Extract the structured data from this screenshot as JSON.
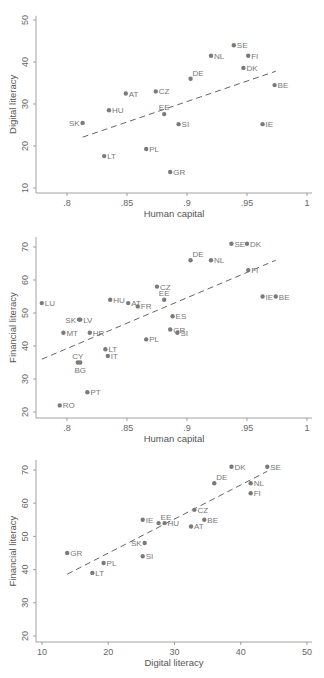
{
  "chart_data": [
    {
      "type": "scatter",
      "title": "",
      "xlabel": "Human capital",
      "ylabel": "Digital literacy",
      "xlim": [
        0.775,
        1.005
      ],
      "ylim": [
        9,
        51
      ],
      "xticks": [
        0.8,
        0.85,
        0.9,
        0.95,
        1
      ],
      "xtick_labels": [
        ".8",
        ".85",
        ".9",
        ".95",
        "1"
      ],
      "yticks": [
        10,
        20,
        30,
        40,
        50
      ],
      "ytick_labels": [
        "10",
        "20",
        "30",
        "40",
        "50"
      ],
      "grid": false,
      "legend": "none",
      "points": [
        {
          "label": "SE",
          "x": 0.939,
          "y": 44.0
        },
        {
          "label": "NL",
          "x": 0.92,
          "y": 41.5
        },
        {
          "label": "FI",
          "x": 0.951,
          "y": 41.5
        },
        {
          "label": "DK",
          "x": 0.947,
          "y": 38.6
        },
        {
          "label": "DE",
          "x": 0.903,
          "y": 36.0
        },
        {
          "label": "BE",
          "x": 0.973,
          "y": 34.5
        },
        {
          "label": "CZ",
          "x": 0.874,
          "y": 33.0
        },
        {
          "label": "AT",
          "x": 0.849,
          "y": 32.5
        },
        {
          "label": "HU",
          "x": 0.835,
          "y": 28.5
        },
        {
          "label": "EE",
          "x": 0.881,
          "y": 27.6
        },
        {
          "label": "SK",
          "x": 0.813,
          "y": 25.5
        },
        {
          "label": "SI",
          "x": 0.893,
          "y": 25.2
        },
        {
          "label": "IE",
          "x": 0.963,
          "y": 25.2
        },
        {
          "label": "PL",
          "x": 0.866,
          "y": 19.3
        },
        {
          "label": "LT",
          "x": 0.831,
          "y": 17.6
        },
        {
          "label": "GR",
          "x": 0.886,
          "y": 13.8
        }
      ],
      "fit_line": {
        "x": [
          0.813,
          0.974
        ],
        "y": [
          22.1,
          37.8
        ],
        "style": "dashed"
      }
    },
    {
      "type": "scatter",
      "title": "",
      "xlabel": "Human capital",
      "ylabel": "Financial literacy",
      "xlim": [
        0.775,
        1.005
      ],
      "ylim": [
        18,
        73
      ],
      "xticks": [
        0.8,
        0.85,
        0.9,
        0.95,
        1
      ],
      "xtick_labels": [
        ".8",
        ".85",
        ".9",
        ".95",
        "1"
      ],
      "yticks": [
        20,
        30,
        40,
        50,
        60,
        70
      ],
      "ytick_labels": [
        "20",
        "30",
        "40",
        "50",
        "60",
        "70"
      ],
      "grid": false,
      "legend": "none",
      "points": [
        {
          "label": "SE",
          "x": 0.937,
          "y": 71.0
        },
        {
          "label": "DK",
          "x": 0.95,
          "y": 71.0
        },
        {
          "label": "DE",
          "x": 0.903,
          "y": 66.0
        },
        {
          "label": "NL",
          "x": 0.92,
          "y": 66.0
        },
        {
          "label": "FI",
          "x": 0.951,
          "y": 63.0
        },
        {
          "label": "CZ",
          "x": 0.875,
          "y": 58.0
        },
        {
          "label": "EE",
          "x": 0.881,
          "y": 54.0
        },
        {
          "label": "IE",
          "x": 0.963,
          "y": 55.0
        },
        {
          "label": "BE",
          "x": 0.974,
          "y": 55.0
        },
        {
          "label": "LU",
          "x": 0.779,
          "y": 53.0
        },
        {
          "label": "HU",
          "x": 0.836,
          "y": 54.0
        },
        {
          "label": "AT",
          "x": 0.851,
          "y": 53.0
        },
        {
          "label": "FR",
          "x": 0.859,
          "y": 52.0
        },
        {
          "label": "ES",
          "x": 0.888,
          "y": 49.0
        },
        {
          "label": "SK",
          "x": 0.81,
          "y": 48.0
        },
        {
          "label": "LV",
          "x": 0.811,
          "y": 48.0
        },
        {
          "label": "GR",
          "x": 0.886,
          "y": 45.0
        },
        {
          "label": "SI",
          "x": 0.892,
          "y": 44.0
        },
        {
          "label": "MT",
          "x": 0.797,
          "y": 44.0
        },
        {
          "label": "HR",
          "x": 0.819,
          "y": 44.0
        },
        {
          "label": "PL",
          "x": 0.866,
          "y": 42.0
        },
        {
          "label": "LT",
          "x": 0.832,
          "y": 39.0
        },
        {
          "label": "IT",
          "x": 0.834,
          "y": 37.0
        },
        {
          "label": "CY",
          "x": 0.809,
          "y": 35.0
        },
        {
          "label": "BG",
          "x": 0.811,
          "y": 35.0
        },
        {
          "label": "PT",
          "x": 0.817,
          "y": 26.0
        },
        {
          "label": "RO",
          "x": 0.794,
          "y": 22.0
        }
      ],
      "fit_line": {
        "x": [
          0.779,
          0.974
        ],
        "y": [
          36.0,
          66.0
        ],
        "style": "dashed"
      }
    },
    {
      "type": "scatter",
      "title": "",
      "xlabel": "Digital literacy",
      "ylabel": "Financial literacy",
      "xlim": [
        9,
        51
      ],
      "ylim": [
        18,
        73
      ],
      "xticks": [
        10,
        20,
        30,
        40,
        50
      ],
      "xtick_labels": [
        "10",
        "20",
        "30",
        "40",
        "50"
      ],
      "yticks": [
        20,
        30,
        40,
        50,
        60,
        70
      ],
      "ytick_labels": [
        "20",
        "30",
        "40",
        "50",
        "60",
        "70"
      ],
      "grid": false,
      "legend": "none",
      "points": [
        {
          "label": "DK",
          "x": 38.6,
          "y": 71.0
        },
        {
          "label": "SE",
          "x": 44.0,
          "y": 71.0
        },
        {
          "label": "DE",
          "x": 36.0,
          "y": 66.0
        },
        {
          "label": "NL",
          "x": 41.5,
          "y": 66.0
        },
        {
          "label": "FI",
          "x": 41.5,
          "y": 63.0
        },
        {
          "label": "CZ",
          "x": 33.0,
          "y": 58.0
        },
        {
          "label": "IE",
          "x": 25.2,
          "y": 55.0
        },
        {
          "label": "BE",
          "x": 34.5,
          "y": 55.0
        },
        {
          "label": "EE",
          "x": 27.6,
          "y": 54.0
        },
        {
          "label": "HU",
          "x": 28.5,
          "y": 54.0
        },
        {
          "label": "AT",
          "x": 32.5,
          "y": 53.0
        },
        {
          "label": "SK",
          "x": 25.5,
          "y": 48.0
        },
        {
          "label": "GR",
          "x": 13.8,
          "y": 45.0
        },
        {
          "label": "SI",
          "x": 25.2,
          "y": 44.0
        },
        {
          "label": "PL",
          "x": 19.3,
          "y": 42.0
        },
        {
          "label": "LT",
          "x": 17.6,
          "y": 39.0
        }
      ],
      "fit_line": {
        "x": [
          13.8,
          44.0
        ],
        "y": [
          38.6,
          69.6
        ],
        "style": "dashed"
      }
    }
  ],
  "layout": [
    {
      "top": 0,
      "height": 225,
      "plot": {
        "x0": 36,
        "x1": 312,
        "y_axis_px": 193
      },
      "xmap": {
        "v0": 0.8,
        "p0": 67,
        "v1": 1.0,
        "p1": 307
      },
      "ymap": {
        "v0": 10,
        "p0": 188,
        "v1": 50,
        "p1": 20
      }
    },
    {
      "top": 0,
      "height": 450,
      "plot": {
        "x0": 36,
        "x1": 312,
        "y_axis_px": 418
      },
      "xmap": {
        "v0": 0.8,
        "p0": 67,
        "v1": 1.0,
        "p1": 307
      },
      "ymap": {
        "v0": 20,
        "p0": 412,
        "v1": 70,
        "p1": 247
      }
    },
    {
      "top": 0,
      "height": 678,
      "plot": {
        "x0": 36,
        "x1": 312,
        "y_axis_px": 642
      },
      "xmap": {
        "v0": 10,
        "p0": 42,
        "v1": 50,
        "p1": 307
      },
      "ymap": {
        "v0": 20,
        "p0": 636,
        "v1": 70,
        "p1": 470
      }
    }
  ],
  "label_offsets": {
    "0": {
      "SK": "left",
      "DE": "upright",
      "EE": "up"
    },
    "1": {
      "SK": "left",
      "CY": "up",
      "BG": "down",
      "DE": "upright",
      "EE": "up"
    },
    "2": {
      "SK": "left",
      "EE": "upright",
      "DE": "upright"
    }
  }
}
